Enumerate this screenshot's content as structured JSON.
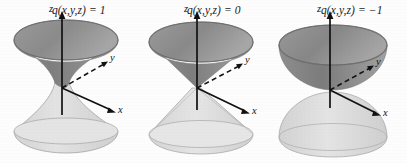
{
  "figure": {
    "background_color": "#fdfdfd",
    "ink_color": "#1b1b1b",
    "upper_surface_color": "#8d8d8d",
    "lower_surface_color": "#d8d8d8",
    "panel_count": 3
  },
  "panels": [
    {
      "id": "panel-one-sheet",
      "equation": "q(x,y,z) = 1",
      "surface_name": "hyperboloid-of-one-sheet",
      "axes": {
        "z": "z",
        "y": "y",
        "x": "x"
      },
      "upper_shade": "#878787",
      "lower_shade": "#dadada"
    },
    {
      "id": "panel-cone",
      "equation": "q(x,y,z) = 0",
      "surface_name": "double-cone",
      "axes": {
        "z": "z",
        "y": "y",
        "x": "x"
      },
      "upper_shade": "#8a8a8a",
      "lower_shade": "#dcdcdc"
    },
    {
      "id": "panel-two-sheet",
      "equation": "q(x,y,z) = −1",
      "surface_name": "hyperboloid-of-two-sheets",
      "axes": {
        "z": "z",
        "y": "y",
        "x": "x"
      },
      "upper_shade": "#8b8b8b",
      "lower_shade": "#dbdbdb"
    }
  ]
}
